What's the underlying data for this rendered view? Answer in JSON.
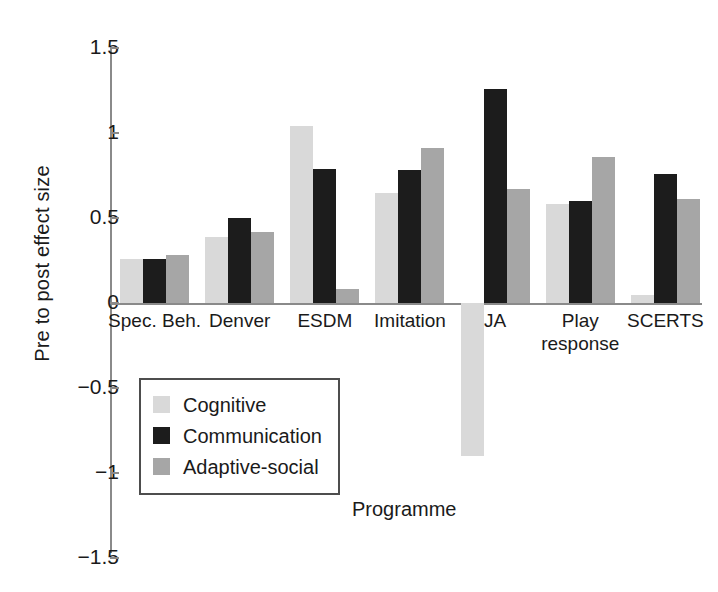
{
  "chart_data": {
    "type": "bar",
    "title": "",
    "xlabel": "Programme",
    "ylabel": "Pre to post effect size",
    "ylim": [
      -1.5,
      1.5
    ],
    "ytick_labels": [
      "1.5",
      "1",
      "0.5",
      "0",
      "−0.5",
      "−1",
      "−1.5"
    ],
    "ytick_values": [
      1.5,
      1,
      0.5,
      0,
      -0.5,
      -1,
      -1.5
    ],
    "grid": false,
    "legend_position": "inside-lower-left",
    "categories": [
      "Spec. Beh.",
      "Denver",
      "ESDM",
      "Imitation",
      "JA",
      "Play response",
      "SCERTS"
    ],
    "series": [
      {
        "name": "Cognitive",
        "color": "#d9d9d9",
        "values": [
          0.26,
          0.39,
          1.04,
          0.65,
          -0.9,
          0.58,
          0.05
        ]
      },
      {
        "name": "Communication",
        "color": "#1c1c1c",
        "values": [
          0.26,
          0.5,
          0.79,
          0.78,
          1.26,
          0.6,
          0.76
        ]
      },
      {
        "name": "Adaptive-social",
        "color": "#a6a6a6",
        "values": [
          0.28,
          0.42,
          0.08,
          0.91,
          0.67,
          0.86,
          0.61
        ]
      }
    ]
  },
  "axis": {
    "y_title": "Pre to post effect size",
    "x_title": "Programme"
  }
}
